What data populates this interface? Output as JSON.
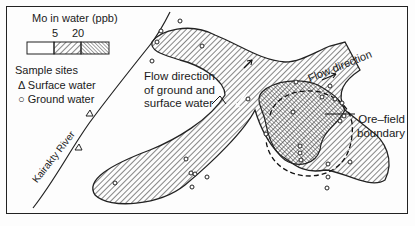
{
  "legend": {
    "title": "Mo in water (ppb)",
    "thresholds": [
      "5",
      "20"
    ],
    "classes": [
      {
        "range": "<5",
        "fill": "blank"
      },
      {
        "range": "5-20",
        "fill": "hatched-light"
      },
      {
        "range": ">20",
        "fill": "hatched-dense"
      }
    ],
    "sample_sites_title": "Sample sites",
    "surface_water": "Δ Surface water",
    "ground_water": "○ Ground water"
  },
  "labels": {
    "flow_ground_surface": [
      "Flow direction",
      "of ground and",
      "surface water"
    ],
    "flow_direction": "Flow direction",
    "ore_field_boundary": [
      "Ore–field",
      "boundary"
    ],
    "river": "Kairakty River"
  },
  "colors": {
    "ink": "#1a1a1a",
    "background": "#fdfdfd"
  }
}
